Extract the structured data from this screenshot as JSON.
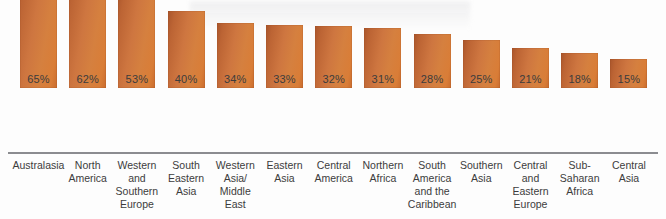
{
  "chart_data": {
    "type": "bar",
    "title": "",
    "subtitle": "",
    "xlabel": "",
    "ylabel": "",
    "ylim": [
      0,
      65
    ],
    "grid": false,
    "legend": null,
    "orientation": "vertical",
    "value_labels_shown": true,
    "value_label_suffix": "%",
    "categories": [
      "Australasia",
      "North America",
      "Western and Southern Europe",
      "South Eastern Asia",
      "Western Asia/ Middle East",
      "Eastern Asia",
      "Central America",
      "Northern Africa",
      "South America and the Caribbean",
      "Southern Asia",
      "Central and Eastern Europe",
      "Sub-Saharan Africa",
      "Central Asia"
    ],
    "category_lines": [
      [
        "Australasia"
      ],
      [
        "North",
        "America"
      ],
      [
        "Western",
        "and",
        "Southern",
        "Europe"
      ],
      [
        "South",
        "Eastern",
        "Asia"
      ],
      [
        "Western",
        "Asia/",
        "Middle",
        "East"
      ],
      [
        "Eastern",
        "Asia"
      ],
      [
        "Central",
        "America"
      ],
      [
        "Northern",
        "Africa"
      ],
      [
        "South",
        "America",
        "and the",
        "Caribbean"
      ],
      [
        "Southern",
        "Asia"
      ],
      [
        "Central",
        "and",
        "Eastern",
        "Europe"
      ],
      [
        "Sub-",
        "Saharan",
        "Africa"
      ],
      [
        "Central",
        "Asia"
      ]
    ],
    "values": [
      65,
      62,
      53,
      40,
      34,
      33,
      32,
      31,
      28,
      25,
      21,
      18,
      15
    ],
    "value_labels": [
      "65%",
      "62%",
      "53%",
      "40%",
      "34%",
      "33%",
      "32%",
      "31%",
      "28%",
      "25%",
      "21%",
      "18%",
      "15%"
    ],
    "colors": {
      "bar_dark": "#a9552b",
      "bar_mid": "#ce7640",
      "bar_light": "#d9803c",
      "axis": "#8b8c90",
      "text": "#3c3c3c",
      "background": "#fdfdfd"
    }
  }
}
